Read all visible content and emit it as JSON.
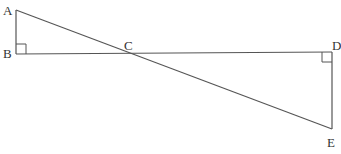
{
  "diagram": {
    "type": "geometry",
    "points": {
      "A": {
        "label": "A",
        "x": 16,
        "y": 10
      },
      "B": {
        "label": "B",
        "x": 16,
        "y": 54
      },
      "C": {
        "label": "C",
        "x": 128,
        "y": 53
      },
      "D": {
        "label": "D",
        "x": 332,
        "y": 52
      },
      "E": {
        "label": "E",
        "x": 332,
        "y": 129
      }
    },
    "segments": [
      "AB",
      "BD",
      "AE",
      "DE"
    ],
    "right_angles": [
      "B",
      "D"
    ],
    "line_color": "#555555"
  }
}
